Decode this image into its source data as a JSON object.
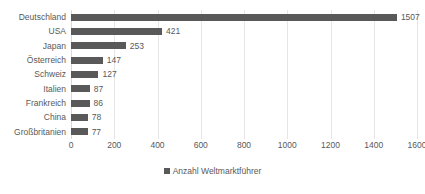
{
  "chart_data": {
    "type": "bar",
    "orientation": "horizontal",
    "title": "",
    "xlabel": "",
    "ylabel": "",
    "categories": [
      "Deutschland",
      "USA",
      "Japan",
      "Österreich",
      "Schweiz",
      "Italien",
      "Frankreich",
      "China",
      "Großbritanien"
    ],
    "values": [
      1507,
      421,
      253,
      147,
      127,
      87,
      86,
      78,
      77
    ],
    "data_labels": [
      "1507",
      "421",
      "253",
      "147",
      "127",
      "87",
      "86",
      "78",
      "77"
    ],
    "series": [
      {
        "name": "Anzahl Weltmarktführer",
        "values": [
          1507,
          421,
          253,
          147,
          127,
          87,
          86,
          78,
          77
        ]
      }
    ],
    "xlim": [
      0,
      1600
    ],
    "xticks": [
      0,
      200,
      400,
      600,
      800,
      1000,
      1200,
      1400,
      1600
    ],
    "xtick_labels": [
      "0",
      "200",
      "400",
      "600",
      "800",
      "1000",
      "1200",
      "1400",
      "1600"
    ],
    "grid": "vertical",
    "legend": {
      "position": "bottom",
      "entries": [
        "Anzahl Weltmarktführer"
      ]
    },
    "colors": {
      "bar": "#595959",
      "grid": "#e6e6e6",
      "text": "#595959",
      "background": "#ffffff"
    }
  }
}
